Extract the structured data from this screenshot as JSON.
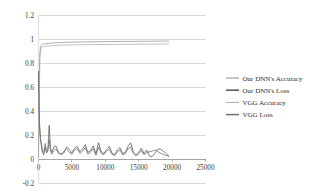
{
  "chart_data": {
    "type": "line",
    "title": "",
    "xlabel": "",
    "ylabel": "",
    "xlim": [
      0,
      25000
    ],
    "ylim": [
      -0.2,
      1.2
    ],
    "xticks": [
      0,
      5000,
      10000,
      15000,
      20000,
      25000
    ],
    "yticks": [
      -0.2,
      0,
      0.2,
      0.4,
      0.6,
      0.8,
      1,
      1.2
    ],
    "xtick_labels": [
      "0",
      "5000",
      "10000",
      "15000",
      "20000",
      "25000"
    ],
    "ytick_labels": [
      "-0.2",
      "0",
      "0.2",
      "0.4",
      "0.6",
      "0.8",
      "1",
      "1.2"
    ],
    "grid": "horizontal",
    "legend_position": "right",
    "series": [
      {
        "name": "Our DNN's Accuracy",
        "color": "#8d8d8d",
        "x": [
          0,
          100,
          200,
          300,
          400,
          600,
          800,
          1000,
          1500,
          2000,
          2500,
          3000,
          4000,
          5000,
          6000,
          7000,
          8000,
          9000,
          10000,
          11000,
          12000,
          13000,
          14000,
          15000,
          16000,
          17000,
          18000,
          19000,
          19500
        ],
        "values": [
          0.02,
          0.55,
          0.88,
          0.93,
          0.948,
          0.955,
          0.958,
          0.96,
          0.963,
          0.966,
          0.968,
          0.97,
          0.972,
          0.974,
          0.975,
          0.976,
          0.977,
          0.978,
          0.978,
          0.979,
          0.979,
          0.98,
          0.98,
          0.981,
          0.981,
          0.982,
          0.982,
          0.983,
          0.983
        ]
      },
      {
        "name": "Our DNN's Loss",
        "color": "#555555",
        "x": [
          0,
          150,
          300,
          450,
          600,
          800,
          1000,
          1200,
          1400,
          1600,
          1800,
          2000,
          2300,
          2600,
          3000,
          3400,
          3800,
          4200,
          4600,
          5000,
          5400,
          5800,
          6200,
          6600,
          7000,
          7400,
          7800,
          8200,
          8600,
          9000,
          9400,
          9800,
          10200,
          10600,
          11000,
          11400,
          11800,
          12200,
          12600,
          13000,
          13400,
          13800,
          14200,
          14600,
          15000,
          15400,
          15800,
          16200,
          16600,
          17000,
          17400,
          17800,
          18200,
          18600,
          19000,
          19400,
          19500
        ],
        "values": [
          0.73,
          0.3,
          0.18,
          0.1,
          0.055,
          0.035,
          0.1,
          0.05,
          0.075,
          0.28,
          0.09,
          0.055,
          0.1,
          0.11,
          0.055,
          0.035,
          0.05,
          0.1,
          0.08,
          0.05,
          0.09,
          0.105,
          0.06,
          0.085,
          0.12,
          0.055,
          0.07,
          0.11,
          0.045,
          0.135,
          0.06,
          0.045,
          0.08,
          0.105,
          0.05,
          0.035,
          0.075,
          0.095,
          0.045,
          0.055,
          0.105,
          0.135,
          0.06,
          0.035,
          0.055,
          0.09,
          0.045,
          0.075,
          0.025,
          0.02,
          0.045,
          0.08,
          0.085,
          0.07,
          0.05,
          0.03,
          0.025
        ]
      },
      {
        "name": "VGG Accuracy",
        "color": "#a8a8a8",
        "x": [
          0,
          100,
          200,
          300,
          400,
          600,
          800,
          1000,
          1500,
          2000,
          2500,
          3000,
          4000,
          5000,
          6000,
          7000,
          8000,
          9000,
          10000,
          11000,
          12000,
          13000,
          14000,
          15000,
          16000,
          17000,
          18000,
          19000,
          19500
        ],
        "values": [
          0.01,
          0.45,
          0.84,
          0.905,
          0.925,
          0.932,
          0.936,
          0.94,
          0.943,
          0.945,
          0.947,
          0.948,
          0.95,
          0.951,
          0.952,
          0.953,
          0.953,
          0.954,
          0.954,
          0.955,
          0.955,
          0.956,
          0.956,
          0.957,
          0.957,
          0.957,
          0.958,
          0.958,
          0.958
        ]
      },
      {
        "name": "VGG Loss",
        "color": "#6e6e6e",
        "x": [
          0,
          150,
          300,
          450,
          600,
          800,
          1000,
          1200,
          1400,
          1600,
          1800,
          2000,
          2300,
          2600,
          3000,
          3400,
          3800,
          4200,
          4600,
          5000,
          5400,
          5800,
          6200,
          6600,
          7000,
          7400,
          7800,
          8200,
          8600,
          9000,
          9400,
          9800,
          10200,
          10600,
          11000,
          11400,
          11800,
          12200,
          12600,
          13000,
          13400,
          13800,
          14200,
          14600,
          15000,
          15400,
          15800,
          16200,
          16600,
          17000,
          17400,
          17800,
          18200,
          18600,
          19000,
          19400,
          19500
        ],
        "values": [
          0.7,
          0.26,
          0.155,
          0.125,
          0.065,
          0.055,
          0.13,
          0.07,
          0.065,
          0.16,
          0.06,
          0.04,
          0.07,
          0.085,
          0.045,
          0.045,
          0.065,
          0.085,
          0.055,
          0.04,
          0.075,
          0.085,
          0.045,
          0.065,
          0.095,
          0.04,
          0.055,
          0.085,
          0.03,
          0.1,
          0.045,
          0.035,
          0.065,
          0.08,
          0.04,
          0.03,
          0.06,
          0.075,
          0.035,
          0.045,
          0.085,
          0.1,
          0.045,
          0.025,
          0.04,
          0.07,
          0.035,
          0.055,
          0.06,
          0.065,
          0.075,
          0.065,
          0.05,
          0.04,
          0.03,
          0.025,
          0.02
        ]
      }
    ]
  },
  "legend": {
    "items": [
      {
        "label": "Our DNN's Accuracy"
      },
      {
        "label": "Our DNN's Loss"
      },
      {
        "label": "VGG Accuracy"
      },
      {
        "label": "VGG Loss"
      }
    ]
  },
  "colors": {
    "grid": "#c9c9c9",
    "axis": "#9a9a9a",
    "text": "#3a3a3a",
    "background": "#ffffff"
  }
}
